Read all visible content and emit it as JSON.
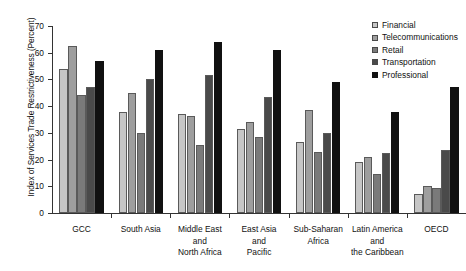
{
  "chart_data": {
    "type": "bar",
    "title": "",
    "xlabel": "",
    "ylabel": "Index of Services Trade Restrictiveness (Percent)",
    "ylim": [
      0,
      70
    ],
    "yticks": [
      0,
      10,
      20,
      30,
      40,
      50,
      60,
      70
    ],
    "grid": false,
    "legend_position": "top-right",
    "categories": [
      "GCC",
      "South Asia",
      "Middle East and North Africa",
      "East Asia and Pacific",
      "Sub-Saharan Africa",
      "Latin America and the Caribbean",
      "OECD"
    ],
    "category_lines": [
      [
        "GCC"
      ],
      [
        "South Asia"
      ],
      [
        "Middle East",
        "and",
        "North Africa"
      ],
      [
        "East Asia",
        "and",
        "Pacific"
      ],
      [
        "Sub-Saharan",
        "Africa"
      ],
      [
        "Latin America",
        "and",
        "the Caribbean"
      ],
      [
        "OECD"
      ]
    ],
    "series": [
      {
        "name": "Financial",
        "color": "#c6c6c6",
        "values": [
          54.0,
          38.0,
          37.0,
          31.5,
          26.5,
          19.0,
          7.0
        ]
      },
      {
        "name": "Telecommunications",
        "color": "#9e9e9e",
        "values": [
          62.5,
          45.0,
          36.5,
          34.0,
          38.5,
          21.0,
          10.0
        ]
      },
      {
        "name": "Retail",
        "color": "#7a7a7a",
        "values": [
          44.0,
          30.0,
          25.5,
          28.5,
          23.0,
          14.5,
          9.5
        ]
      },
      {
        "name": "Transportation",
        "color": "#4a4a4a",
        "values": [
          47.0,
          50.0,
          51.5,
          43.5,
          30.0,
          22.5,
          23.5
        ]
      },
      {
        "name": "Professional",
        "color": "#111111",
        "values": [
          57.0,
          61.0,
          64.0,
          61.0,
          49.0,
          38.0,
          47.0
        ]
      }
    ]
  }
}
